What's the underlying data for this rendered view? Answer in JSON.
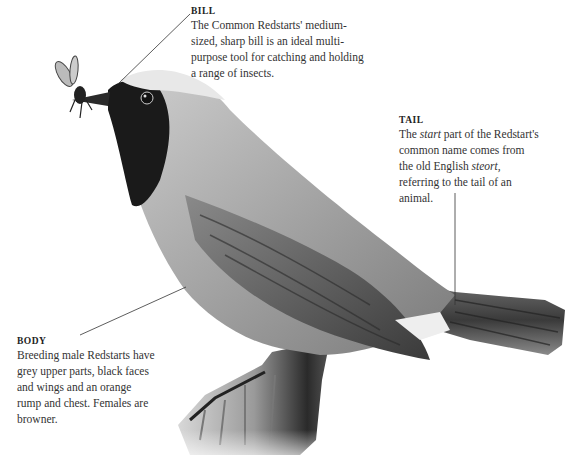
{
  "labels": {
    "bill": {
      "heading": "BILL",
      "text": "The Common Redstarts' medium-sized, sharp bill is an ideal multi-purpose tool for catching and holding a range of insects."
    },
    "tail": {
      "heading": "TAIL",
      "text_pre": "The ",
      "text_em1": "start",
      "text_mid": " part of the Redstart's common name comes from the old English ",
      "text_em2": "steort,",
      "text_post": " referring to the tail of an animal."
    },
    "body": {
      "heading": "BODY",
      "text": "Breeding male Redstarts have grey upper parts, black faces and wings and an orange rump and chest. Females are browner."
    }
  },
  "illustration": {
    "subject": "Common Redstart perched on wooden post holding insect",
    "colors": {
      "black": "#1a1a1a",
      "grey_dark": "#555555",
      "grey_mid": "#8a8a8a",
      "grey_light": "#c8c8c8",
      "white": "#f2f2f2"
    }
  }
}
